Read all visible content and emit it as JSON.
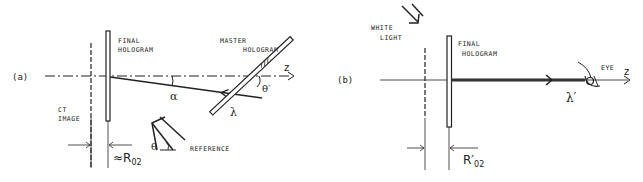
{
  "panel_a": {
    "tag": "(a)",
    "final_hologram": [
      "FINAL",
      "HOLOGRAM"
    ],
    "master_hologram": [
      "MASTER",
      "HOLOGRAM"
    ],
    "ct_image": [
      "CT",
      "IMAGE"
    ],
    "reference": "REFERENCE",
    "axis": "z",
    "alpha": "α",
    "lambda": "λ",
    "theta_prime": "θ′",
    "theta": "θ",
    "distance": "≈R",
    "distance_sub": "02"
  },
  "panel_b": {
    "tag": "(b)",
    "white_light": [
      "WHITE",
      "LIGHT"
    ],
    "final_hologram": [
      "FINAL",
      "HOLOGRAM"
    ],
    "eye": "EYE",
    "axis": "z",
    "lambda_prime": "λ′",
    "distance": "R′",
    "distance_sub": "02"
  }
}
